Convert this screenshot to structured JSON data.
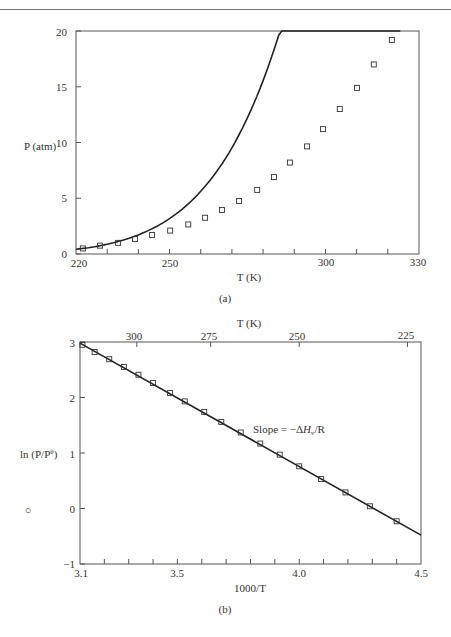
{
  "chart_data": [
    {
      "id": "a",
      "type": "line",
      "caption": "(a)",
      "title": "",
      "xlabel": "T (K)",
      "ylabel": "P (atm)",
      "xlim": [
        220,
        330
      ],
      "ylim": [
        0,
        20
      ],
      "x_ticks": [
        220,
        250,
        300,
        330
      ],
      "x_minor_ticks": [
        230,
        240,
        260,
        270,
        280,
        290,
        310,
        320
      ],
      "y_ticks": [
        0,
        5,
        10,
        15,
        20
      ],
      "grid": false,
      "legend": null,
      "series": [
        {
          "name": "data",
          "marker": "square",
          "x": [
            222.2,
            227.7,
            233.5,
            238.9,
            244.4,
            250.2,
            256.0,
            261.4,
            266.8,
            272.3,
            278.1,
            283.5,
            288.6,
            294.1,
            299.2,
            304.6,
            310.1,
            315.5,
            321.3
          ],
          "y": [
            0.5,
            0.75,
            1.0,
            1.35,
            1.7,
            2.1,
            2.65,
            3.25,
            3.95,
            4.75,
            5.75,
            6.9,
            8.2,
            9.65,
            11.2,
            13.0,
            14.9,
            17.0,
            19.2
          ]
        },
        {
          "name": "fit",
          "style": "solid line",
          "x": [
            220,
            230,
            240,
            250,
            260,
            270,
            280,
            290,
            300,
            310,
            320,
            324
          ],
          "y": [
            0.42,
            0.85,
            1.45,
            2.1,
            3.1,
            4.4,
            6.1,
            8.6,
            11.6,
            14.9,
            18.8,
            20.0
          ]
        }
      ]
    },
    {
      "id": "b",
      "type": "line",
      "caption": "(b)",
      "title": "",
      "xlabel": "1000/T",
      "ylabel": "ln (P/Pθ)",
      "top_xlabel": "T (K)",
      "xlim": [
        3.1,
        4.5
      ],
      "ylim": [
        -1,
        3
      ],
      "x_ticks": [
        3.1,
        3.5,
        4.0,
        4.5
      ],
      "x_minor_ticks": [
        3.2,
        3.3,
        3.4,
        3.6,
        3.7,
        3.8,
        3.9,
        4.1,
        4.2,
        4.3,
        4.4
      ],
      "top_x_ticks": [
        300,
        275,
        250,
        225
      ],
      "y_ticks": [
        -1,
        0,
        1,
        2,
        3
      ],
      "grid": false,
      "legend": null,
      "annotation": "Slope = −ΔHv/R",
      "series": [
        {
          "name": "data",
          "marker": "square",
          "x": [
            3.11,
            3.16,
            3.22,
            3.28,
            3.34,
            3.4,
            3.47,
            3.53,
            3.61,
            3.68,
            3.76,
            3.84,
            3.92,
            4.0,
            4.09,
            4.19,
            4.29,
            4.4
          ],
          "y": [
            2.95,
            2.82,
            2.69,
            2.55,
            2.41,
            2.26,
            2.08,
            1.93,
            1.74,
            1.56,
            1.37,
            1.17,
            0.97,
            0.76,
            0.53,
            0.29,
            0.04,
            -0.23
          ]
        },
        {
          "name": "fit",
          "style": "solid line",
          "x": [
            3.1,
            4.5
          ],
          "y": [
            2.98,
            -0.48
          ]
        }
      ]
    }
  ],
  "chart_a": {
    "ylabel": "P (atm)",
    "xlabel": "T (K)",
    "caption": "(a)",
    "y_tick_labels": [
      "0",
      "5",
      "10",
      "15",
      "20"
    ],
    "x_tick_labels": [
      "220",
      "250",
      "300",
      "330"
    ]
  },
  "chart_b": {
    "ylabel_main": "ln (P/P",
    "ylabel_sup": "θ",
    "ylabel_close": ")",
    "xlabel": "1000/T",
    "top_xlabel": "T (K)",
    "caption": "(b)",
    "annotation_prefix": "Slope = −Δ",
    "annotation_h": "H",
    "annotation_sub": "v",
    "annotation_suffix": "/R",
    "y_tick_labels": [
      "−1",
      "0",
      "1",
      "2",
      "3"
    ],
    "x_tick_labels": [
      "3.1",
      "3.5",
      "4.0",
      "4.5"
    ],
    "top_x_tick_labels": [
      "300",
      "275",
      "250",
      "225"
    ],
    "stray_mark": "○"
  }
}
